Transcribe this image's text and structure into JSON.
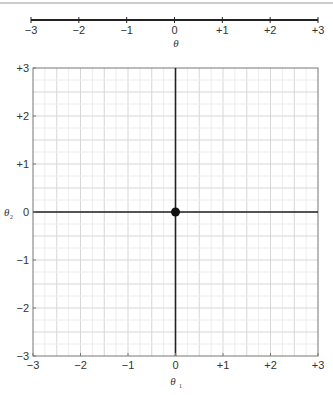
{
  "chart_data": [
    {
      "type": "line",
      "title": "",
      "xlabel": "θ",
      "ylabel": "",
      "xlim": [
        -3,
        3
      ],
      "x_ticks": [
        -3,
        -2,
        -1,
        0,
        1,
        2,
        3
      ],
      "x_tick_labels": [
        "−3",
        "−2",
        "−1",
        "0",
        "+1",
        "+2",
        "+3"
      ],
      "grid": false,
      "description": "One-dimensional number line for θ"
    },
    {
      "type": "scatter",
      "title": "",
      "xlabel": "θ1",
      "ylabel": "θ2",
      "xlim": [
        -3,
        3
      ],
      "ylim": [
        -3,
        3
      ],
      "x_ticks": [
        -3,
        -2,
        -1,
        0,
        1,
        2,
        3
      ],
      "x_tick_labels": [
        "−3",
        "−2",
        "−1",
        "0",
        "+1",
        "+2",
        "+3"
      ],
      "y_ticks": [
        3,
        2,
        1,
        0,
        -1,
        -2,
        -3
      ],
      "y_tick_labels": [
        "+3",
        "+2",
        "+1",
        "0",
        "−1",
        "−2",
        "−3"
      ],
      "grid": true,
      "grid_minor_step": 0.25,
      "axes_lines_at_zero": true,
      "series": [
        {
          "name": "point",
          "x": [
            0
          ],
          "y": [
            0
          ],
          "marker": "filled-circle",
          "color": "#111111"
        }
      ]
    }
  ],
  "labels": {
    "line_xlabel": "θ",
    "plot_xlabel_main": "θ",
    "plot_xlabel_sub": "1",
    "plot_ylabel_main": "θ",
    "plot_ylabel_sub": "2"
  },
  "colors": {
    "axis": "#222222",
    "frame": "#777777",
    "grid_major": "#d6d6d6",
    "grid_minor": "#ececec",
    "point": "#111111"
  }
}
